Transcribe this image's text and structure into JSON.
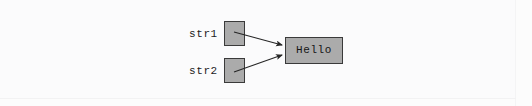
{
  "figure": {
    "kind": "object-reference-diagram",
    "width": 532,
    "height": 106,
    "background_color": "#fcfcfc"
  },
  "colors": {
    "box_fill": "#ababab",
    "box_border": "#3a3a3a",
    "text": "#1d1d1d",
    "arrow": "#262626",
    "page": "#fcfcfc"
  },
  "variables": [
    {
      "label": "str1",
      "box_name": "str1-reference-box",
      "points_to": "Hello"
    },
    {
      "label": "str2",
      "box_name": "str2-reference-box",
      "points_to": "Hello"
    }
  ],
  "object": {
    "value": "Hello",
    "box_name": "hello-object-box"
  },
  "arrows": [
    {
      "name": "arrow-str1-to-hello",
      "from": "str1",
      "to": "Hello",
      "x1": 234,
      "y1": 32,
      "x2": 284,
      "y2": 45
    },
    {
      "name": "arrow-str2-to-hello",
      "from": "str2",
      "to": "Hello",
      "x1": 234,
      "y1": 72,
      "x2": 284,
      "y2": 55
    }
  ]
}
